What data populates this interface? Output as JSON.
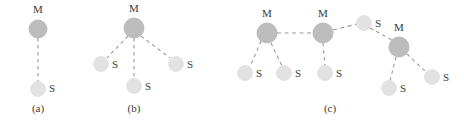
{
  "figure": {
    "width": 464,
    "height": 123,
    "background": "#ffffff",
    "master_fill": "#bdbdbd",
    "master_stroke": "#b0b0b0",
    "slave_fill": "#e2e2e2",
    "slave_stroke": "#dcdcdc",
    "edge_color": "#999999",
    "label_color": "#3a3a3a",
    "master_label": "M",
    "slave_label": "S"
  },
  "subfigures": [
    {
      "id": "a",
      "caption": "(a)",
      "caption_x": 38,
      "caption_y": 112,
      "nodes": [
        {
          "id": "a-m1",
          "type": "master",
          "label": "M",
          "cx": 38,
          "cy": 29,
          "r": 9,
          "label_x": 38,
          "label_y": 13
        },
        {
          "id": "a-s1",
          "type": "slave",
          "label": "S",
          "cx": 38,
          "cy": 89,
          "r": 7.5,
          "label_x": 52,
          "label_y": 92
        }
      ],
      "edges": [
        {
          "from": "a-m1",
          "to": "a-s1",
          "x1": 38,
          "y1": 38,
          "x2": 38,
          "y2": 82
        }
      ]
    },
    {
      "id": "b",
      "caption": "(b)",
      "caption_x": 134,
      "caption_y": 112,
      "nodes": [
        {
          "id": "b-m1",
          "type": "master",
          "label": "M",
          "cx": 134,
          "cy": 28,
          "r": 10,
          "label_x": 134,
          "label_y": 12
        },
        {
          "id": "b-s1",
          "type": "slave",
          "label": "S",
          "cx": 101,
          "cy": 64,
          "r": 7.5,
          "label_x": 115,
          "label_y": 68
        },
        {
          "id": "b-s2",
          "type": "slave",
          "label": "S",
          "cx": 134,
          "cy": 86,
          "r": 7.5,
          "label_x": 148,
          "label_y": 90
        },
        {
          "id": "b-s3",
          "type": "slave",
          "label": "S",
          "cx": 176,
          "cy": 64,
          "r": 7.5,
          "label_x": 190,
          "label_y": 68
        }
      ],
      "edges": [
        {
          "from": "b-m1",
          "to": "b-s1",
          "x1": 128,
          "y1": 36,
          "x2": 107,
          "y2": 58
        },
        {
          "from": "b-m1",
          "to": "b-s2",
          "x1": 134,
          "y1": 38,
          "x2": 134,
          "y2": 79
        },
        {
          "from": "b-m1",
          "to": "b-s3",
          "x1": 141,
          "y1": 36,
          "x2": 170,
          "y2": 58
        }
      ]
    },
    {
      "id": "c",
      "caption": "(c)",
      "caption_x": 330,
      "caption_y": 112,
      "nodes": [
        {
          "id": "c-m1",
          "type": "master",
          "label": "M",
          "cx": 267,
          "cy": 33,
          "r": 10,
          "label_x": 267,
          "label_y": 17
        },
        {
          "id": "c-m2",
          "type": "master",
          "label": "M",
          "cx": 323,
          "cy": 33,
          "r": 10,
          "label_x": 323,
          "label_y": 17
        },
        {
          "id": "c-m3",
          "type": "master",
          "label": "M",
          "cx": 399,
          "cy": 47,
          "r": 10,
          "label_x": 399,
          "label_y": 31
        },
        {
          "id": "c-s1",
          "type": "slave",
          "label": "S",
          "cx": 245,
          "cy": 73,
          "r": 7.5,
          "label_x": 259,
          "label_y": 77
        },
        {
          "id": "c-s2",
          "type": "slave",
          "label": "S",
          "cx": 284,
          "cy": 73,
          "r": 7.5,
          "label_x": 298,
          "label_y": 77
        },
        {
          "id": "c-s3",
          "type": "slave",
          "label": "S",
          "cx": 325,
          "cy": 73,
          "r": 7.5,
          "label_x": 339,
          "label_y": 77
        },
        {
          "id": "c-s4",
          "type": "slave",
          "label": "S",
          "cx": 364,
          "cy": 23,
          "r": 7.5,
          "label_x": 378,
          "label_y": 27
        },
        {
          "id": "c-s5",
          "type": "slave",
          "label": "S",
          "cx": 389,
          "cy": 88,
          "r": 7.5,
          "label_x": 403,
          "label_y": 92
        },
        {
          "id": "c-s6",
          "type": "slave",
          "label": "S",
          "cx": 432,
          "cy": 77,
          "r": 7.5,
          "label_x": 446,
          "label_y": 81
        }
      ],
      "edges": [
        {
          "from": "c-m1",
          "to": "c-m2",
          "x1": 277,
          "y1": 33,
          "x2": 313,
          "y2": 33
        },
        {
          "from": "c-m1",
          "to": "c-s1",
          "x1": 261,
          "y1": 41,
          "x2": 250,
          "y2": 67
        },
        {
          "from": "c-m1",
          "to": "c-s2",
          "x1": 271,
          "y1": 43,
          "x2": 282,
          "y2": 66
        },
        {
          "from": "c-m2",
          "to": "c-s3",
          "x1": 323,
          "y1": 43,
          "x2": 325,
          "y2": 66
        },
        {
          "from": "c-m2",
          "to": "c-s4",
          "x1": 333,
          "y1": 30,
          "x2": 357,
          "y2": 24
        },
        {
          "from": "c-s4",
          "to": "c-m3",
          "x1": 370,
          "y1": 28,
          "x2": 392,
          "y2": 40
        },
        {
          "from": "c-m3",
          "to": "c-s5",
          "x1": 396,
          "y1": 57,
          "x2": 390,
          "y2": 81
        },
        {
          "from": "c-m3",
          "to": "c-s6",
          "x1": 407,
          "y1": 54,
          "x2": 426,
          "y2": 72
        }
      ]
    }
  ]
}
